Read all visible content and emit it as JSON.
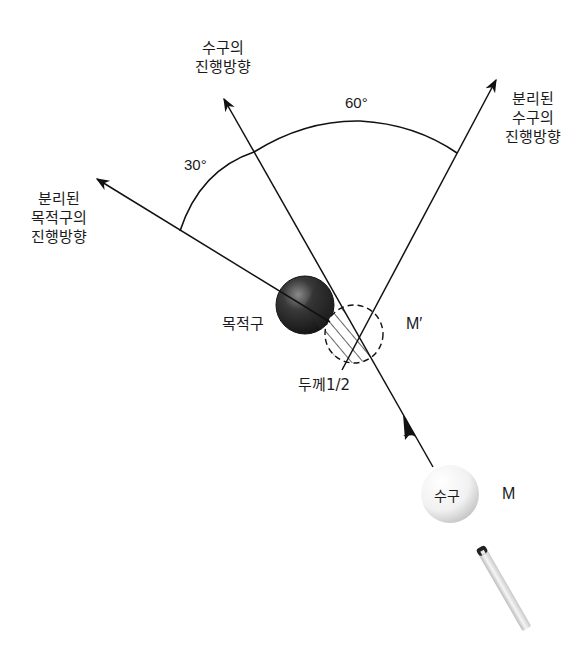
{
  "diagram": {
    "title": "",
    "labels": {
      "cue_ball_direction": [
        "수구의",
        "진행방향"
      ],
      "separated_target_direction": [
        "분리된",
        "목적구의",
        "진행방향"
      ],
      "separated_cue_direction": [
        "분리된",
        "수구의",
        "진행방향"
      ],
      "angle_30": "30°",
      "angle_60": "60°",
      "target_ball": "목적구",
      "ghost_ball": "M′",
      "thickness": "두께1/2",
      "cue_ball": "수구",
      "cue_ball_position": "M"
    },
    "colors": {
      "line": "#111111",
      "target_ball_dark": "#1e1e1e",
      "target_ball_light": "#6a6a6a",
      "cue_ball": "#f4f4f4",
      "cue_stick": "#d8d8d8",
      "cue_tip": "#222222"
    },
    "angles_deg": {
      "target_from_cue_path": 30,
      "cue_from_cue_path": 60
    }
  }
}
